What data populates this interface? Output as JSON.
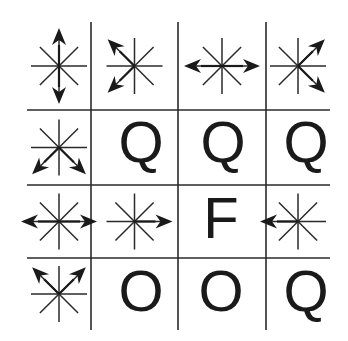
{
  "figure": {
    "line_color": "#2a2a2a",
    "ink_color": "#1a1a1a",
    "columns_x": [
      27,
      91,
      178,
      266,
      330
    ],
    "rows_y": [
      22,
      110,
      185,
      258,
      330
    ],
    "cells": [
      [
        {
          "type": "star",
          "arrows": [
            "up",
            "down"
          ]
        },
        {
          "type": "star",
          "arrows": [
            "upleft",
            "downleft"
          ]
        },
        {
          "type": "star",
          "arrows": [
            "left",
            "right"
          ]
        },
        {
          "type": "star",
          "arrows": [
            "upright",
            "downright"
          ]
        }
      ],
      [
        {
          "type": "star",
          "arrows": [
            "downleft",
            "downright"
          ]
        },
        {
          "type": "letter",
          "text": "Q"
        },
        {
          "type": "letter",
          "text": "Q"
        },
        {
          "type": "letter",
          "text": "Q"
        }
      ],
      [
        {
          "type": "star",
          "arrows": [
            "left",
            "right"
          ]
        },
        {
          "type": "star",
          "arrows": [
            "right"
          ]
        },
        {
          "type": "letter",
          "text": "F"
        },
        {
          "type": "star",
          "arrows": [
            "left"
          ]
        }
      ],
      [
        {
          "type": "star",
          "arrows": [
            "upleft",
            "upright"
          ]
        },
        {
          "type": "letter",
          "text": "O"
        },
        {
          "type": "letter",
          "text": "O"
        },
        {
          "type": "letter",
          "text": "Q"
        }
      ]
    ]
  },
  "labels": {
    "r1c1": "Q",
    "r1c2": "Q",
    "r1c3": "Q",
    "r2c2": "F",
    "r3c1": "O",
    "r3c2": "O",
    "r3c3": "Q"
  }
}
